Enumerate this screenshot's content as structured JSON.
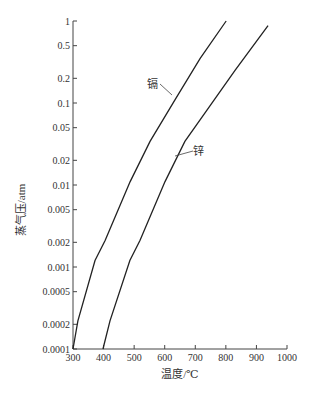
{
  "chart_data": {
    "type": "line",
    "title": "",
    "xlabel": "温度/℃",
    "ylabel": "蒸气压/atm",
    "xlim": [
      300,
      1000
    ],
    "ylim": [
      0.0001,
      1
    ],
    "yscale": "log",
    "grid": false,
    "x_ticks": [
      "300",
      "400",
      "500",
      "600",
      "700",
      "800",
      "900",
      "1000"
    ],
    "y_ticks": [
      "1",
      "0.5",
      "0.2",
      "0.1",
      "0.05",
      "0.02",
      "0.01",
      "0.005",
      "0.002",
      "0.001",
      "0.0005",
      "0.0002",
      "0.0001"
    ],
    "series": [
      {
        "name": "镉",
        "x": [
          300,
          316,
          372,
          405,
          487,
          552,
          634,
          716,
          801
        ],
        "y": [
          0.0001,
          0.00022,
          0.0012,
          0.0021,
          0.011,
          0.034,
          0.11,
          0.35,
          1.0
        ]
      },
      {
        "name": "锌",
        "x": [
          398,
          421,
          486,
          519,
          601,
          666,
          748,
          830,
          938
        ],
        "y": [
          0.0001,
          0.00022,
          0.0012,
          0.0021,
          0.011,
          0.034,
          0.092,
          0.25,
          0.88
        ]
      }
    ],
    "annotations": [
      {
        "text": "镉",
        "target": "镉"
      },
      {
        "text": "锌",
        "target": "锌"
      }
    ]
  },
  "labels": {
    "cd": "镉",
    "zn": "锌",
    "xlabel": "温度/℃",
    "ylabel": "蒸气压/atm"
  }
}
